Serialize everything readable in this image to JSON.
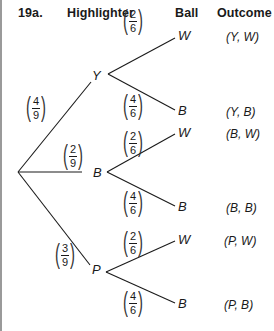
{
  "problem_label": "19a.",
  "headers": {
    "highlighter": "Highlighter",
    "ball": "Ball",
    "outcome": "Outcome"
  },
  "first_level": [
    {
      "node": "Y",
      "probability": {
        "num": "4",
        "den": "9"
      }
    },
    {
      "node": "B",
      "probability": {
        "num": "2",
        "den": "9"
      }
    },
    {
      "node": "P",
      "probability": {
        "num": "3",
        "den": "9"
      }
    }
  ],
  "second_level": [
    {
      "parent": "Y",
      "branches": [
        {
          "ball": "W",
          "probability": {
            "num": "2",
            "den": "6"
          },
          "outcome": "(Y, W)"
        },
        {
          "ball": "B",
          "probability": {
            "num": "4",
            "den": "6"
          },
          "outcome": "(Y, B)"
        }
      ]
    },
    {
      "parent": "B",
      "branches": [
        {
          "ball": "W",
          "probability": {
            "num": "2",
            "den": "6"
          },
          "outcome": "(B, W)"
        },
        {
          "ball": "B",
          "probability": {
            "num": "4",
            "den": "6"
          },
          "outcome": "(B, B)"
        }
      ]
    },
    {
      "parent": "P",
      "branches": [
        {
          "ball": "W",
          "probability": {
            "num": "2",
            "den": "6"
          },
          "outcome": "(P, W)"
        },
        {
          "ball": "B",
          "probability": {
            "num": "4",
            "den": "6"
          },
          "outcome": "(P, B)"
        }
      ]
    }
  ]
}
